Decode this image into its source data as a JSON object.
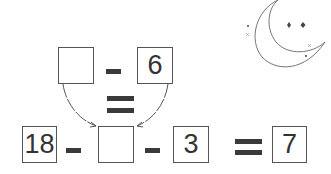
{
  "puzzle": {
    "top_row": {
      "left_box": "",
      "operator": "minus",
      "right_box": "6"
    },
    "link": "equals",
    "bottom_row": {
      "box1": "18",
      "op1": "minus",
      "box2": "",
      "op2": "minus",
      "box3": "3",
      "result_op": "equals",
      "result": "7"
    }
  },
  "decoration": {
    "icon": "crescent-moon-with-stars"
  }
}
